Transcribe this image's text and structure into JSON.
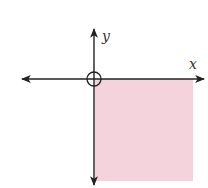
{
  "diagram": {
    "type": "coordinate-plane-region",
    "axes": {
      "x_label": "x",
      "y_label": "y"
    },
    "origin_marker": "open-circle",
    "shaded_region": {
      "quadrant": "IV",
      "condition": "x >= 0 and y <= 0",
      "fill_color": "#f5d3dc"
    },
    "colors": {
      "axis": "#222222",
      "shade": "#f5d3dc"
    }
  }
}
